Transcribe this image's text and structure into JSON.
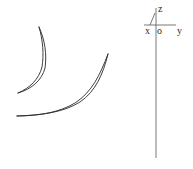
{
  "diagram": {
    "type": "blade-profiles-with-coordinate-frame",
    "colors": {
      "background": "#ffffff",
      "stroke": "#2a2a2a",
      "axis": "#555555"
    },
    "coordinate_frame": {
      "labels": {
        "z": "z",
        "x": "x",
        "origin": "o",
        "y": "y"
      }
    },
    "profiles": [
      {
        "name": "upper-blade-profile"
      },
      {
        "name": "lower-blade-profile"
      }
    ]
  }
}
